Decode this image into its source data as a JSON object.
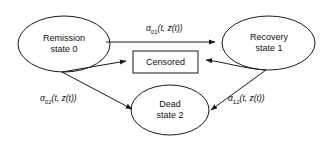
{
  "figure": {
    "background_color": "#ffffff",
    "line_color": "#1a1a1a"
  },
  "nodes": [
    {
      "id": "remission",
      "shape": "ellipse",
      "line1": "Remission",
      "line2": "state 0"
    },
    {
      "id": "recovery",
      "shape": "ellipse",
      "line1": "Recovery",
      "line2": "state 1"
    },
    {
      "id": "dead",
      "shape": "ellipse",
      "line1": "Dead",
      "line2": "state 2"
    },
    {
      "id": "censored",
      "shape": "rectangle",
      "line1": "Censored",
      "line2": ""
    }
  ],
  "edges": [
    {
      "id": "remission-to-recovery",
      "from": "remission",
      "to": "recovery",
      "alpha": "α",
      "subscript": "01",
      "args": "(t, z(t))"
    },
    {
      "id": "remission-to-dead",
      "from": "remission",
      "to": "dead",
      "alpha": "α",
      "subscript": "02",
      "args": "(t, z(t))"
    },
    {
      "id": "recovery-to-dead",
      "from": "recovery",
      "to": "dead",
      "alpha": "α",
      "subscript": "12",
      "args": "(t, z(t))"
    },
    {
      "id": "remission-to-censored",
      "from": "remission",
      "to": "censored",
      "alpha": "",
      "subscript": "",
      "args": ""
    },
    {
      "id": "recovery-to-censored",
      "from": "recovery",
      "to": "censored",
      "alpha": "",
      "subscript": "",
      "args": ""
    }
  ]
}
